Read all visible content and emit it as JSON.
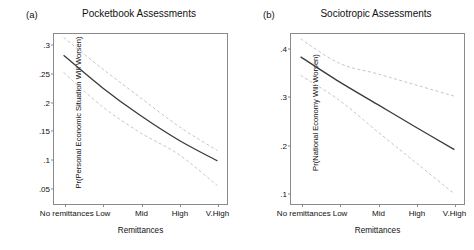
{
  "figure": {
    "width": 474,
    "height": 250,
    "background": "#ffffff"
  },
  "panels": [
    {
      "tag": "(a)",
      "title": "Pocketbook Assessments"
    },
    {
      "tag": "(b)",
      "title": "Sociotropic Assessments"
    }
  ],
  "chart_data": [
    {
      "type": "line",
      "panel_tag": "(a)",
      "title": "Pocketbook Assessments",
      "xlabel": "Remittances",
      "ylabel": "Pr(Personal Economic Situation Will Worsen)",
      "categories": [
        "No remittances",
        "Low",
        "Mid",
        "High",
        "V.High"
      ],
      "x": [
        0,
        1,
        2,
        3,
        4
      ],
      "xlim": [
        -0.25,
        4.25
      ],
      "ylim": [
        0.022,
        0.318
      ],
      "yticks": [
        0.05,
        0.1,
        0.15,
        0.2,
        0.25,
        0.3
      ],
      "ytick_labels": [
        ".05",
        ".1",
        ".15",
        ".2",
        ".25",
        ".3"
      ],
      "grid": false,
      "legend": "none",
      "series": [
        {
          "name": "Predicted probability",
          "style": "solid",
          "color": "#3a3a3a",
          "values": [
            0.281,
            0.225,
            0.176,
            0.133,
            0.097
          ]
        },
        {
          "name": "95% CI upper",
          "style": "dashed",
          "color": "#c0c0c0",
          "values": [
            0.312,
            0.258,
            0.207,
            0.157,
            0.115
          ]
        },
        {
          "name": "95% CI lower",
          "style": "dashed",
          "color": "#c0c0c0",
          "values": [
            0.251,
            0.192,
            0.146,
            0.108,
            0.054
          ]
        }
      ]
    },
    {
      "type": "line",
      "panel_tag": "(b)",
      "title": "Sociotropic Assessments",
      "xlabel": "Remittances",
      "ylabel": "Pr(National Economy Will Worsen)",
      "categories": [
        "No remittances",
        "Low",
        "Mid",
        "High",
        "V.High"
      ],
      "x": [
        0,
        1,
        2,
        3,
        4
      ],
      "xlim": [
        -0.25,
        4.25
      ],
      "ylim": [
        0.078,
        0.428
      ],
      "yticks": [
        0.1,
        0.2,
        0.3,
        0.4
      ],
      "ytick_labels": [
        ".1",
        ".2",
        ".3",
        ".4"
      ],
      "grid": false,
      "legend": "none",
      "series": [
        {
          "name": "Predicted probability",
          "style": "solid",
          "color": "#3a3a3a",
          "values": [
            0.381,
            0.33,
            0.283,
            0.236,
            0.19
          ]
        },
        {
          "name": "95% CI upper",
          "style": "dashed",
          "color": "#c0c0c0",
          "values": [
            0.418,
            0.368,
            0.346,
            0.323,
            0.3
          ]
        },
        {
          "name": "95% CI lower",
          "style": "dashed",
          "color": "#c0c0c0",
          "values": [
            0.343,
            0.292,
            0.227,
            0.163,
            0.099
          ]
        }
      ]
    }
  ],
  "axis_style": {
    "frame_color": "#8a8a8a",
    "solid_color": "#3a3a3a",
    "ci_color": "#c0c0c0",
    "text_color": "#111111"
  }
}
